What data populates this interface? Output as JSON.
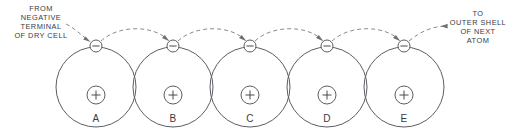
{
  "figure": {
    "type": "electron-flow-diagram",
    "width": 513,
    "height": 138,
    "background_color": "#ffffff",
    "stroke_color": "#5d5d63",
    "dash_color": "#8a8a90",
    "text_color": "#3a3a40"
  },
  "captions": {
    "left": {
      "lines": [
        "FROM",
        "NEGATIVE",
        "TERMINAL",
        "OF DRY CELL"
      ],
      "align": "center"
    },
    "right": {
      "lines": [
        "TO",
        "OUTER SHELL",
        "OF NEXT",
        "ATOM"
      ],
      "align": "center"
    }
  },
  "atoms": [
    {
      "label": "A",
      "cx": 96,
      "cy": 87,
      "orbit_r": 40,
      "nucleus_r": 9,
      "nucleus_cy": 95,
      "nucleus_charge": "+",
      "electron_cx": 96,
      "electron_cy": 46,
      "electron_charge": "−"
    },
    {
      "label": "B",
      "cx": 173,
      "cy": 87,
      "orbit_r": 40,
      "nucleus_r": 9,
      "nucleus_cy": 95,
      "nucleus_charge": "+",
      "electron_cx": 173,
      "electron_cy": 46,
      "electron_charge": "−"
    },
    {
      "label": "C",
      "cx": 250,
      "cy": 87,
      "orbit_r": 40,
      "nucleus_r": 9,
      "nucleus_cy": 95,
      "nucleus_charge": "+",
      "electron_cx": 250,
      "electron_cy": 46,
      "electron_charge": "−"
    },
    {
      "label": "D",
      "cx": 327,
      "cy": 87,
      "orbit_r": 40,
      "nucleus_r": 9,
      "nucleus_cy": 95,
      "nucleus_charge": "+",
      "electron_cx": 327,
      "electron_cy": 46,
      "electron_charge": "−"
    },
    {
      "label": "E",
      "cx": 404,
      "cy": 87,
      "orbit_r": 40,
      "nucleus_r": 9,
      "nucleus_cy": 95,
      "nucleus_charge": "+",
      "electron_cx": 404,
      "electron_cy": 46,
      "electron_charge": "−"
    }
  ],
  "flow_arrows": [
    {
      "name": "entry-arrow",
      "from": "caption-left",
      "to": "electron-A",
      "direction": "down-right"
    },
    {
      "name": "arc-a-to-b",
      "from": "electron-A",
      "to": "electron-B",
      "direction": "arc-up"
    },
    {
      "name": "arc-b-to-c",
      "from": "electron-B",
      "to": "electron-C",
      "direction": "arc-up"
    },
    {
      "name": "arc-c-to-d",
      "from": "electron-C",
      "to": "electron-D",
      "direction": "arc-up"
    },
    {
      "name": "arc-d-to-e",
      "from": "electron-D",
      "to": "electron-E",
      "direction": "arc-up"
    },
    {
      "name": "exit-arrow",
      "from": "electron-E",
      "to": "caption-right",
      "direction": "up-right-to-left-head"
    }
  ],
  "atom_labels": {
    "a": "A",
    "b": "B",
    "c": "C",
    "d": "D",
    "e": "E"
  },
  "nucleus_signs": {
    "a": "+",
    "b": "+",
    "c": "+",
    "d": "+",
    "e": "+"
  },
  "electron_signs": {
    "a": "−",
    "b": "−",
    "c": "−",
    "d": "−",
    "e": "−"
  },
  "caption_left_lines": {
    "l1": "FROM",
    "l2": "NEGATIVE",
    "l3": "TERMINAL",
    "l4": "OF DRY CELL"
  },
  "caption_right_lines": {
    "l1": "TO",
    "l2": "OUTER SHELL",
    "l3": "OF NEXT",
    "l4": "ATOM"
  }
}
